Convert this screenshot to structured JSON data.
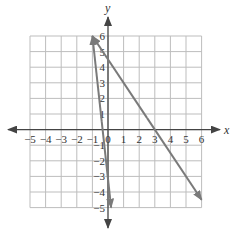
{
  "chart_data": {
    "type": "line",
    "title": "",
    "xlabel": "x",
    "ylabel": "y",
    "xlim": [
      -5,
      6
    ],
    "ylim": [
      -5,
      6
    ],
    "grid": true,
    "x_ticks": [
      -5,
      -4,
      -3,
      -2,
      -1,
      0,
      1,
      2,
      3,
      4,
      5,
      6
    ],
    "y_ticks": [
      6,
      5,
      4,
      3,
      2,
      1,
      -1,
      -2,
      -3,
      -4,
      -5
    ],
    "series": [
      {
        "name": "line-steep",
        "points": [
          [
            -1,
            6
          ],
          [
            0.2,
            -5
          ]
        ],
        "arrows": "both",
        "color": "#7a7a7a"
      },
      {
        "name": "line-shallow",
        "points": [
          [
            -1,
            6
          ],
          [
            6,
            -4.5
          ]
        ],
        "equation": "y = -1.5x + 4.5",
        "arrows": "both",
        "color": "#7a7a7a"
      }
    ]
  },
  "axes": {
    "x_label": "x",
    "y_label": "y",
    "x_tick_labels": [
      "−5",
      "−4",
      "−3",
      "−2",
      "−1",
      "0",
      "1",
      "2",
      "3",
      "4",
      "5",
      "6"
    ],
    "y_tick_labels": [
      "6",
      "5",
      "4",
      "3",
      "2",
      "1",
      "−1",
      "−2",
      "−3",
      "−4",
      "−5"
    ]
  },
  "colors": {
    "grid": "#bdbdbd",
    "axis": "#444444",
    "line": "#7a7a7a"
  }
}
